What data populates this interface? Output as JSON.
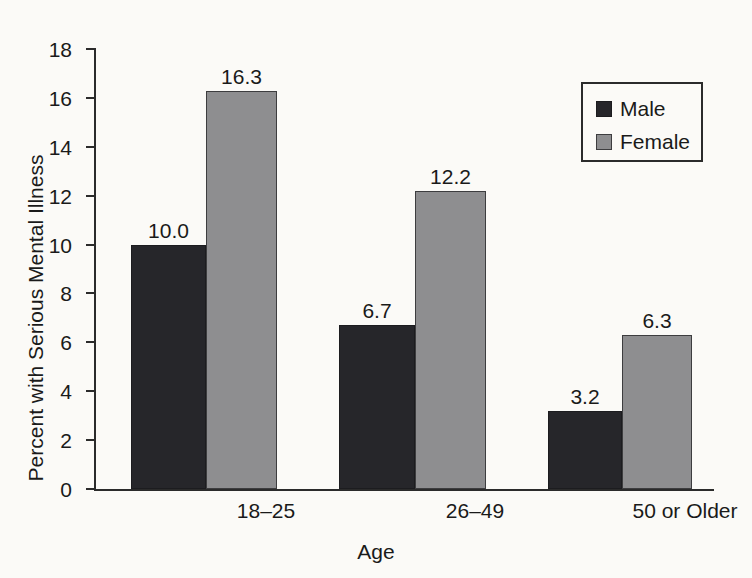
{
  "chart_data": {
    "type": "bar",
    "title": "",
    "subtitle": "",
    "xlabel": "Age",
    "ylabel": "Percent with Serious Mental Illness",
    "categories": [
      "18–25",
      "26–49",
      "50 or Older"
    ],
    "series": [
      {
        "name": "Male",
        "color": "#26262a",
        "values": [
          10.0,
          6.7,
          3.2
        ],
        "labels": [
          "10.0",
          "6.7",
          "3.2"
        ]
      },
      {
        "name": "Female",
        "color": "#8e8e90",
        "values": [
          16.3,
          12.2,
          6.3
        ],
        "labels": [
          "16.3",
          "12.2",
          "6.3"
        ]
      }
    ],
    "ylim": [
      0,
      18
    ],
    "yticks": [
      0,
      2,
      4,
      6,
      8,
      10,
      12,
      14,
      16,
      18
    ],
    "ytick_labels": [
      "0",
      "2",
      "4",
      "6",
      "8",
      "10",
      "12",
      "14",
      "16",
      "18"
    ],
    "grid": false,
    "legend_position": "top-right",
    "legend_entries": [
      "Male",
      "Female"
    ],
    "data_labels_shown": true,
    "background_color": "#fbfaf7",
    "axis_color": "#2b2b2b"
  },
  "legend": {
    "items": [
      {
        "label": "Male",
        "color": "#26262a"
      },
      {
        "label": "Female",
        "color": "#8e8e90"
      }
    ]
  },
  "axes": {
    "y_title": "Percent with Serious Mental Illness",
    "x_title": "Age"
  }
}
